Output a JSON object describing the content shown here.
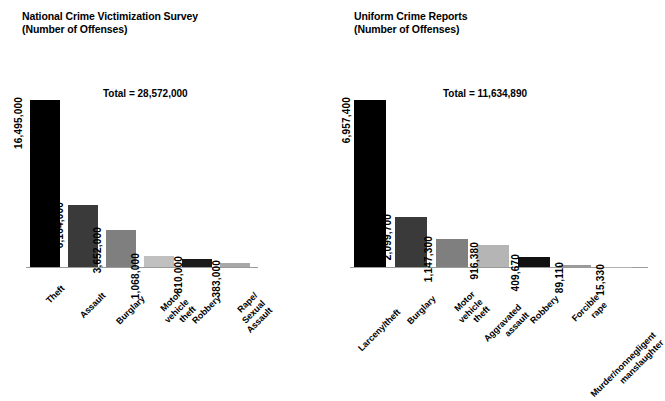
{
  "chart_data": [
    {
      "type": "bar",
      "title": "National Crime Victimization Survey\n(Number of Offenses)",
      "total_label": "Total = 28,572,000",
      "total_value": 28572000,
      "xlabel": "",
      "ylabel": "Number of Offenses",
      "grid": false,
      "legend": "none",
      "ylim": [
        0,
        16495000
      ],
      "categories": [
        "Theft",
        "Assault",
        "Burglary",
        "Motor\nvehicle theft",
        "Robbery",
        "Rape/\nSexual Assault"
      ],
      "values": [
        16495000,
        6164000,
        3652000,
        1068000,
        810000,
        383000
      ],
      "value_labels": [
        "16,495,000",
        "6,164,000",
        "3,652,000",
        "1,068,000",
        "810,000",
        "383,000"
      ],
      "bar_colors": [
        "#000000",
        "#3a3a3a",
        "#7f7f7f",
        "#c0c0c0",
        "#1a1a1a",
        "#a8a8a8"
      ]
    },
    {
      "type": "bar",
      "title": "Uniform Crime Reports\n(Number of Offenses)",
      "total_label": "Total = 11,634,890",
      "total_value": 11634890,
      "xlabel": "",
      "ylabel": "Number of Offenses",
      "grid": false,
      "legend": "none",
      "ylim": [
        0,
        6957400
      ],
      "categories": [
        "Larceny/theft",
        "Burglary",
        "Motor\nvehicle theft",
        "Aggravated assault",
        "Robbery",
        "Forcible rape",
        "Murder/nonnegligent\nmanslaughter"
      ],
      "values": [
        6957400,
        2099700,
        1147300,
        916380,
        409670,
        89110,
        15330
      ],
      "value_labels": [
        "6,957,400",
        "2,099,700",
        "1,147,300",
        "916,380",
        "409,670",
        "89,110",
        "15,330"
      ],
      "bar_colors": [
        "#000000",
        "#3a3a3a",
        "#7f7f7f",
        "#b5b5b5",
        "#111111",
        "#9a9a9a",
        "#b0b0b0"
      ]
    }
  ]
}
